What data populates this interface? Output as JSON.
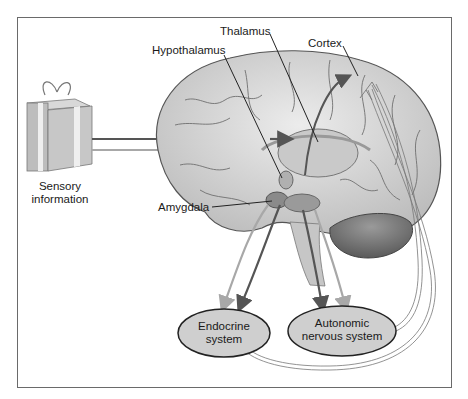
{
  "diagram": {
    "labels": {
      "thalamus": "Thalamus",
      "hypothalamus": "Hypothalamus",
      "cortex": "Cortex",
      "amygdala": "Amygdala",
      "sensory_line1": "Sensory",
      "sensory_line2": "information"
    },
    "nodes": {
      "endocrine_line1": "Endocrine",
      "endocrine_line2": "system",
      "autonomic_line1": "Autonomic",
      "autonomic_line2": "nervous system"
    },
    "icons": {
      "stimulus": "gift-box-icon",
      "brain": "brain-illustration"
    },
    "colors": {
      "dark_pathway": "#555555",
      "light_pathway": "#a8a8a8",
      "node_fill": "#cfcfcf",
      "brain_fill": "#dcdcdc",
      "frame": "#6a6a6a"
    }
  }
}
